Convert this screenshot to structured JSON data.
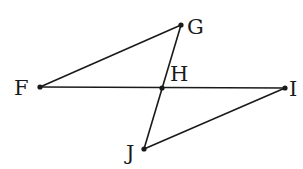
{
  "diagram": {
    "points": [
      {
        "id": "F",
        "x": 40,
        "y": 87,
        "label": "F",
        "lx": 14,
        "ly": 95
      },
      {
        "id": "G",
        "x": 181,
        "y": 25,
        "label": "G",
        "lx": 187,
        "ly": 34
      },
      {
        "id": "H",
        "x": 162,
        "y": 88,
        "label": "H",
        "lx": 170,
        "ly": 81
      },
      {
        "id": "I",
        "x": 285,
        "y": 88,
        "label": "I",
        "lx": 289,
        "ly": 96
      },
      {
        "id": "J",
        "x": 144,
        "y": 149,
        "label": "J",
        "lx": 126,
        "ly": 160
      }
    ],
    "segments": [
      {
        "from": "F",
        "to": "G"
      },
      {
        "from": "F",
        "to": "I"
      },
      {
        "from": "G",
        "to": "J"
      },
      {
        "from": "J",
        "to": "I"
      }
    ]
  }
}
